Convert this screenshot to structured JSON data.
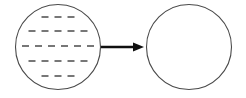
{
  "figure": {
    "type": "process-transformation-diagram",
    "canvas": {
      "width": 246,
      "height": 98,
      "background": "#ffffff"
    },
    "colors": {
      "circle_stroke": "#4a4a4a",
      "dash_stroke": "#555555",
      "arrow": "#101010",
      "background": "#ffffff"
    },
    "shapes": {
      "left_circle": {
        "label": "left-circle",
        "cx": 58,
        "cy": 47,
        "r": 42.5,
        "stroke_width": 1.1,
        "fill": "none",
        "contents": "horizontal-dashes"
      },
      "right_circle": {
        "label": "right-circle",
        "cx": 189,
        "cy": 47,
        "r": 42.5,
        "stroke_width": 1.1,
        "fill": "none",
        "contents": "empty"
      },
      "arrow": {
        "label": "arrow-right",
        "x1": 101,
        "y1": 47,
        "x2": 144,
        "y2": 47,
        "stroke_width": 2.6,
        "head_length": 11,
        "head_width": 9,
        "direction": "right"
      }
    },
    "dash_rows": [
      {
        "row": 1,
        "y": 17,
        "count": 3,
        "dash_length": 7,
        "gap": 6,
        "center_x": 58
      },
      {
        "row": 2,
        "y": 31,
        "count": 5,
        "dash_length": 7,
        "gap": 6,
        "center_x": 58
      },
      {
        "row": 3,
        "y": 46,
        "count": 6,
        "dash_length": 7,
        "gap": 6,
        "center_x": 58
      },
      {
        "row": 4,
        "y": 61,
        "count": 5,
        "dash_length": 7,
        "gap": 6,
        "center_x": 58
      },
      {
        "row": 5,
        "y": 76,
        "count": 3,
        "dash_length": 7,
        "gap": 6,
        "center_x": 58
      }
    ],
    "dash_style": {
      "stroke_width": 1.6,
      "linecap": "butt"
    }
  }
}
